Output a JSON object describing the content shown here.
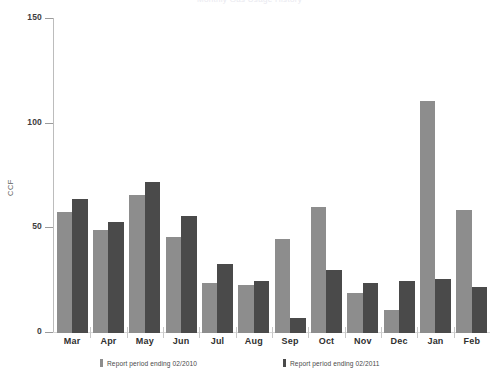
{
  "chart_data": {
    "type": "bar",
    "title": "Monthly Gas Usage History",
    "xlabel": "",
    "ylabel": "CCF",
    "categories": [
      "Mar",
      "Apr",
      "May",
      "Jun",
      "Jul",
      "Aug",
      "Sep",
      "Oct",
      "Nov",
      "Dec",
      "Jan",
      "Feb"
    ],
    "ylim": [
      0,
      150
    ],
    "yticks": [
      0,
      50,
      100,
      150
    ],
    "ytick_labels": [
      "0",
      "50",
      "100",
      "150"
    ],
    "grid": false,
    "legend_position": "bottom",
    "series": [
      {
        "name": "Report period ending 02/2010",
        "color": "#8d8d8d",
        "values": [
          58,
          49,
          66,
          46,
          24,
          23,
          45,
          60,
          19,
          11,
          111,
          59
        ]
      },
      {
        "name": "Report period ending 02/2011",
        "color": "#4a4a4a",
        "values": [
          64,
          53,
          72,
          56,
          33,
          25,
          7,
          30,
          24,
          25,
          26,
          22
        ]
      }
    ]
  },
  "axis": {
    "y_label": "CCF"
  },
  "colors": {
    "series0": "#8d8d8d",
    "series1": "#4a4a4a",
    "axis": "#bcbcbc",
    "text": "#2f2f2f"
  }
}
